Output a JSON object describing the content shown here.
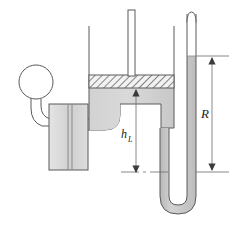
{
  "figure": {
    "name": "piston-cylinder-u-tube-manometer-diagram",
    "type": "engineering-schematic",
    "background_color": "#ffffff",
    "line_color": "#555555",
    "fluid_color": "#cccccc",
    "piston_hatch_color": "#666666"
  },
  "labels": {
    "head_height": "h",
    "head_height_subscript": "L",
    "manometer_reading": "R"
  },
  "components": {
    "bulb": "pressure-bulb",
    "block": "gauge-block",
    "tank": "cylinder-tank",
    "piston": "hatched-piston",
    "rod": "piston-rod",
    "manometer": "u-tube-manometer",
    "connector": "pipe-connector"
  },
  "dimensions": {
    "h_L": {
      "top_y": 90,
      "bottom_y": 172,
      "x": 136,
      "arrow_style": "double-headed-vertical"
    },
    "R": {
      "top_y": 56,
      "bottom_y": 172,
      "x": 212,
      "arrow_style": "double-headed-vertical"
    }
  },
  "colors": {
    "fluid_light": "#d8d8d8",
    "fluid_mid": "#c6c6c6",
    "outline": "#5a5a5a",
    "hatch": "#555555",
    "text": "#1a1a1a"
  }
}
